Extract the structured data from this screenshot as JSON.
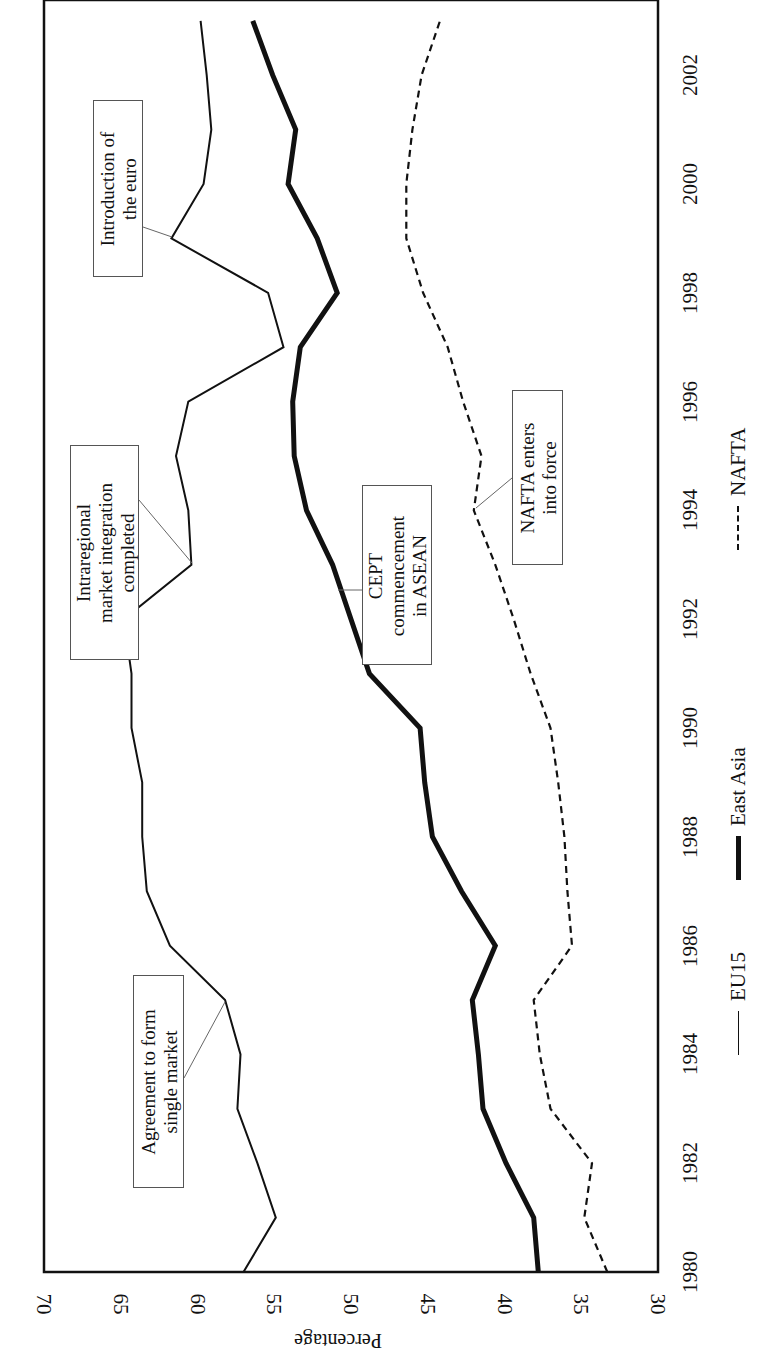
{
  "chart_data": {
    "type": "line",
    "orientation": "rotated 90 degrees (years run bottom-to-top on right edge, percentage runs right-to-left along bottom)",
    "title": "",
    "xlabel": "",
    "ylabel": "Percentage",
    "ylim": [
      30,
      70
    ],
    "yticks": [
      "70",
      "65",
      "60",
      "55",
      "50",
      "45",
      "40",
      "35",
      "30"
    ],
    "xticks": [
      "1980",
      "1982",
      "1984",
      "1986",
      "1988",
      "1990",
      "1992",
      "1994",
      "1996",
      "1998",
      "2000",
      "2002"
    ],
    "grid": false,
    "legend_position": "below plot (rotated)",
    "x": [
      1980,
      1981,
      1982,
      1983,
      1984,
      1985,
      1986,
      1987,
      1988,
      1989,
      1990,
      1991,
      1992,
      1993,
      1994,
      1995,
      1996,
      1997,
      1998,
      1999,
      2000,
      2001,
      2002,
      2003
    ],
    "series": [
      {
        "name": "EU15",
        "style": "thin solid",
        "values": [
          57.0,
          54.9,
          56.1,
          57.4,
          57.2,
          58.2,
          61.8,
          63.3,
          63.6,
          63.6,
          64.3,
          64.3,
          64.8,
          60.4,
          60.6,
          61.4,
          60.6,
          54.4,
          55.4,
          61.7,
          59.6,
          59.1,
          59.4,
          59.8
        ]
      },
      {
        "name": "East Asia",
        "style": "thick solid",
        "values": [
          37.8,
          38.1,
          39.9,
          41.4,
          41.7,
          42.1,
          40.6,
          42.8,
          44.7,
          45.2,
          45.5,
          48.8,
          50.0,
          51.2,
          52.9,
          53.7,
          53.8,
          53.3,
          50.9,
          52.2,
          54.1,
          53.6,
          55.1,
          56.4
        ]
      },
      {
        "name": "NAFTA",
        "style": "dashed",
        "values": [
          33.3,
          34.8,
          34.3,
          37.0,
          37.7,
          38.1,
          35.6,
          35.9,
          36.1,
          36.5,
          37.0,
          38.3,
          39.4,
          40.6,
          42.0,
          41.5,
          42.7,
          43.7,
          45.3,
          46.4,
          46.4,
          46.0,
          45.4,
          44.2
        ]
      }
    ],
    "annotations": [
      {
        "text": "Agreement to form\nsingle market",
        "series": "EU15",
        "year": 1985
      },
      {
        "text": "Intraregional\nmarket integration\ncompleted",
        "series": "EU15",
        "year": 1993
      },
      {
        "text": "Introduction of\nthe euro",
        "series": "EU15",
        "year": 1999
      },
      {
        "text": "CEPT\ncommencement\nin ASEAN",
        "series": "East Asia",
        "year": 1993
      },
      {
        "text": "NAFTA enters\ninto force",
        "series": "NAFTA",
        "year": 1994
      }
    ]
  },
  "axis": {
    "ylabel": "Percentage"
  },
  "legend": {
    "eu15": "EU15",
    "east_asia": "East Asia",
    "nafta": "NAFTA"
  },
  "annotations": {
    "single_market": "Agreement to form\nsingle market",
    "integration": "Intraregional\nmarket integration\ncompleted",
    "euro": "Introduction of\nthe euro",
    "cept": "CEPT\ncommencement\nin ASEAN",
    "nafta": "NAFTA enters\ninto force"
  }
}
